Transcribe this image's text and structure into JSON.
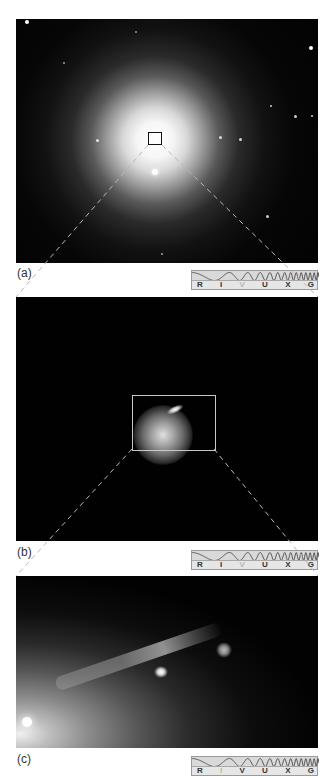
{
  "figure": {
    "panels": [
      {
        "id": "a",
        "label": "(a)",
        "description": "elliptical galaxy with zoom box at core",
        "highlighted_band": "V"
      },
      {
        "id": "b",
        "label": "(b)",
        "description": "galaxy core with jet, zoom box",
        "highlighted_band": "V"
      },
      {
        "id": "c",
        "label": "(c)",
        "description": "close-up of jet emerging from core",
        "highlighted_band": "I"
      }
    ],
    "spectrum_bands": [
      "R",
      "I",
      "V",
      "U",
      "X",
      "G"
    ],
    "colors": {
      "background": "#ffffff",
      "sky": "#020202",
      "zoom_lines": "#b8b8b8",
      "spectrum_fill": "#d9d9d9"
    }
  }
}
